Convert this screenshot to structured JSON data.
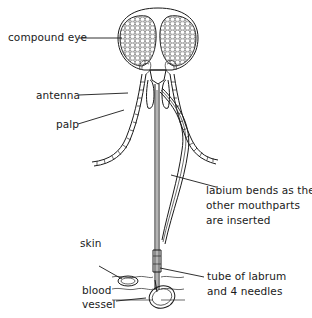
{
  "diagram": {
    "labels": {
      "compound_eye": "compound eye",
      "antenna": "antenna",
      "palp": "palp",
      "labium_line1": "labium bends as the",
      "labium_line2": "other mouthparts",
      "labium_line3": "are inserted",
      "skin": "skin",
      "blood": "blood",
      "vessel": "vessel",
      "tube_line1": "tube of labrum",
      "tube_line2": "and 4 needles"
    },
    "colors": {
      "ink": "#1a1a1a",
      "background": "#ffffff"
    }
  }
}
